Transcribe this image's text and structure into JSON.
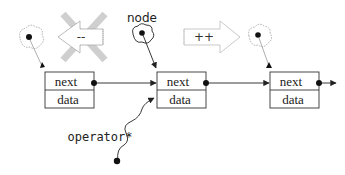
{
  "diagram": {
    "type": "linked-list-iterator",
    "nodes": [
      {
        "id": "prev",
        "fields": [
          "next",
          "data"
        ]
      },
      {
        "id": "current",
        "fields": [
          "next",
          "data"
        ]
      },
      {
        "id": "following",
        "fields": [
          "next",
          "data"
        ]
      }
    ],
    "labels": {
      "node": "node",
      "operator": "operator*",
      "decrement": "--",
      "increment": "++"
    },
    "field_labels": {
      "next": "next",
      "data": "data"
    },
    "colors": {
      "line": "#222222",
      "cross": "#c8c8c8",
      "ghost": "#aaaaaa"
    }
  }
}
